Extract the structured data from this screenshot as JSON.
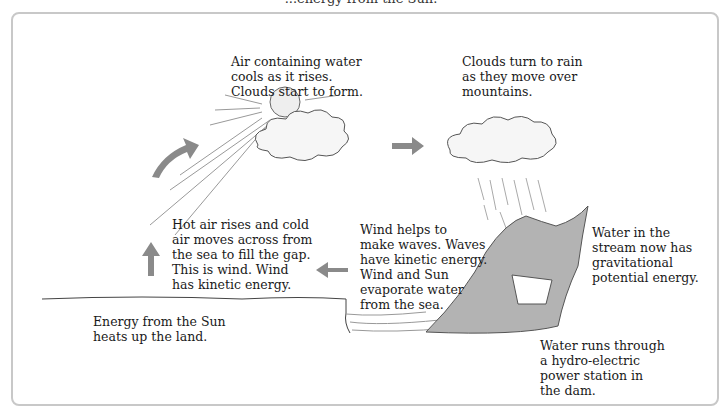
{
  "top_caption": "...energy from the Sun.",
  "labels": {
    "cloud_forms": "Air containing water\ncools as it rises.\nClouds start to form.",
    "rain": "Clouds turn to rain\nas they move over\nmountains.",
    "wind": "Hot air rises and cold\nair moves across from\nthe sea to fill the gap.\nThis is wind. Wind\nhas kinetic energy.",
    "waves": "Wind helps to\nmake waves. Waves\nhave kinetic energy.\nWind and Sun\nevaporate water\nfrom the sea.",
    "stream": "Water in the\nstream now has\ngravitational\npotential energy.",
    "land": "Energy from the Sun\nheats up the land.",
    "dam": "Water runs through\na hydro-electric\npower station in\nthe dam."
  },
  "colors": {
    "arrow": "#8a8a8a",
    "panel_border": "#c8c8c8",
    "mountain": "#a9a9a9"
  }
}
